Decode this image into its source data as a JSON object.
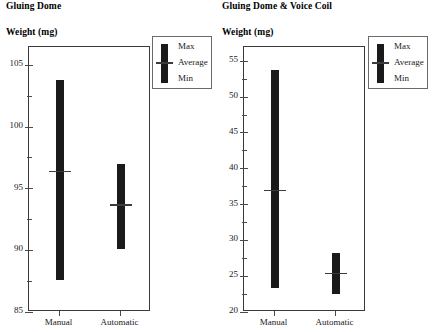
{
  "chart_data": [
    {
      "type": "bar",
      "chart_id": "gluing-dome",
      "title": "Gluing Dome",
      "ylabel": "Weight (mg)",
      "xlabel": "",
      "categories": [
        "Manual",
        "Automatic"
      ],
      "ylim": [
        85,
        106.5
      ],
      "yticks": [
        85,
        90,
        95,
        100,
        105
      ],
      "yticklabels": [
        "85",
        "90",
        "95",
        "100",
        "105"
      ],
      "yminorticks": [
        87.5,
        92.5,
        97.5,
        102.5
      ],
      "grid": false,
      "legend_position": "upper right",
      "legend": [
        "Max",
        "Average",
        "Min"
      ],
      "series": [
        {
          "name": "Max",
          "values": [
            103.8,
            97.0
          ]
        },
        {
          "name": "Average",
          "values": [
            96.4,
            93.7
          ]
        },
        {
          "name": "Min",
          "values": [
            87.6,
            90.1
          ]
        }
      ]
    },
    {
      "type": "bar",
      "chart_id": "gluing-dome-voice-coil",
      "title": "Gluing Dome & Voice Coil",
      "ylabel": "Weight (mg)",
      "xlabel": "",
      "categories": [
        "Manual",
        "Automatic"
      ],
      "ylim": [
        20,
        57
      ],
      "yticks": [
        20,
        25,
        30,
        35,
        40,
        45,
        50,
        55
      ],
      "yticklabels": [
        "20",
        "25",
        "30",
        "35",
        "40",
        "45",
        "50",
        "55"
      ],
      "yminorticks": [
        22.5,
        27.5,
        32.5,
        37.5,
        42.5,
        47.5,
        52.5
      ],
      "grid": false,
      "legend_position": "upper right",
      "legend": [
        "Max",
        "Average",
        "Min"
      ],
      "series": [
        {
          "name": "Max",
          "values": [
            53.8,
            28.2
          ]
        },
        {
          "name": "Average",
          "values": [
            37.0,
            25.4
          ]
        },
        {
          "name": "Min",
          "values": [
            23.4,
            22.5
          ]
        }
      ]
    }
  ],
  "panels": {
    "left": {
      "title": "Gluing Dome",
      "axis_title": "Weight (mg)",
      "legend": {
        "max": "Max",
        "average": "Average",
        "min": "Min"
      }
    },
    "right": {
      "title": "Gluing Dome & Voice Coil",
      "axis_title": "Weight (mg)",
      "legend": {
        "max": "Max",
        "average": "Average",
        "min": "Min"
      }
    }
  }
}
